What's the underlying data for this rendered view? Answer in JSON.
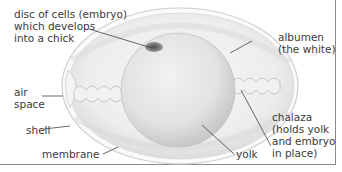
{
  "diagram": {
    "labels": {
      "embryo": [
        "disc of cells (embryo)",
        "which develops",
        "into a chick"
      ],
      "albumen": [
        "albumen",
        "(the white)"
      ],
      "air_space": [
        "air",
        "space"
      ],
      "shell": [
        "shell"
      ],
      "membrane": [
        "membrane"
      ],
      "yolk": [
        "yolk"
      ],
      "chalaza": [
        "chalaza",
        "(holds yolk",
        "and embryo",
        "in place)"
      ]
    },
    "colors": {
      "text": "#3a3a3a",
      "leader_line": "#444444",
      "frame": "#8a8a8a",
      "shell_outline": "#c9c9c9",
      "embryo_disc": "#6f6f6f"
    }
  }
}
